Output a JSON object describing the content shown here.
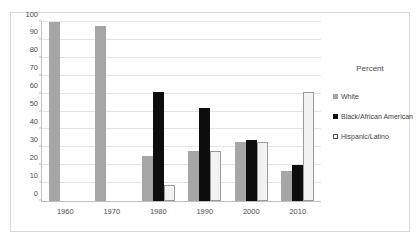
{
  "chart_data": {
    "type": "bar",
    "title": "",
    "xlabel": "",
    "ylabel": "",
    "legend_title": "Percent",
    "legend_position": "right",
    "grid": true,
    "ylim": [
      0,
      100
    ],
    "yticks": [
      0,
      10,
      20,
      30,
      40,
      50,
      60,
      70,
      80,
      90,
      100
    ],
    "ytick_labels": [
      "0",
      "10",
      "20",
      "30",
      "40",
      "50",
      "60",
      "70",
      "80",
      "90",
      "100"
    ],
    "categories": [
      "1960",
      "1970",
      "1980",
      "1990",
      "2000",
      "2010"
    ],
    "series": [
      {
        "name": "White",
        "color": "#a6a6a6",
        "values": [
          100,
          98,
          25,
          28,
          33,
          17
        ]
      },
      {
        "name": "Black/African American",
        "color": "#0d0d0d",
        "values": [
          null,
          null,
          61,
          52,
          34,
          20
        ]
      },
      {
        "name": "Hispanic/Latino",
        "color": "#f2f2f2",
        "values": [
          null,
          null,
          9,
          28,
          33,
          61
        ]
      }
    ]
  },
  "legend": {
    "title": "Percent",
    "items": [
      {
        "label": "White",
        "swatch": "white-series"
      },
      {
        "label": "Black/African American",
        "swatch": "black-series"
      },
      {
        "label": "Hispanic/Latino",
        "swatch": "hispanic-series"
      }
    ]
  }
}
